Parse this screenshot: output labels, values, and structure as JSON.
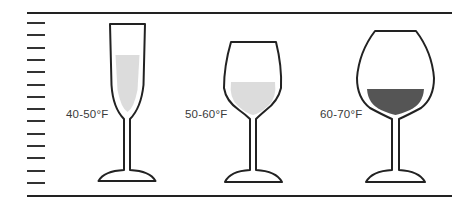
{
  "diagram": {
    "colors": {
      "line": "#222222",
      "tick": "#333333",
      "fill_light": "#dcdcdc",
      "fill_dark": "#555555",
      "label": "#3a3a3a",
      "background": "#ffffff"
    },
    "scale": {
      "top_line_y": 13,
      "bottom_line_y": 196,
      "line_x_start": 27,
      "line_x_end": 452,
      "tick_x_start": 27,
      "tick_x_end": 45,
      "tick_count": 14,
      "tick_y_first": 23,
      "tick_spacing": 12.3
    },
    "glasses": [
      {
        "type": "flute",
        "name": "sparkling",
        "label": "40-50°F",
        "fill_level": "light",
        "label_x": 66,
        "label_y": 108
      },
      {
        "type": "white-wine",
        "name": "white",
        "label": "50-60°F",
        "fill_level": "light",
        "label_x": 185,
        "label_y": 108
      },
      {
        "type": "red-wine",
        "name": "red",
        "label": "60-70°F",
        "fill_level": "dark",
        "label_x": 320,
        "label_y": 108
      }
    ]
  }
}
